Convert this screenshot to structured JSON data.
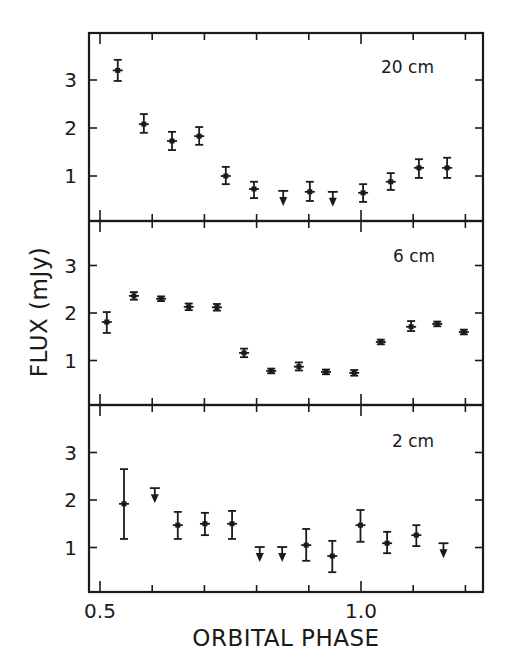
{
  "chart_data": {
    "type": "scatter",
    "title": "",
    "xlabel": "ORBITAL PHASE",
    "ylabel": "FLUX (mJy)",
    "xlim": [
      0.479,
      1.233
    ],
    "x_ticks": [
      0.5,
      0.6,
      0.7,
      0.8,
      0.9,
      1.0,
      1.1,
      1.2
    ],
    "x_tick_labels": [
      {
        "value": 0.5,
        "label": "0.5"
      },
      {
        "value": 1.0,
        "label": "1.0"
      }
    ],
    "grid": false,
    "legend": null,
    "panels": [
      {
        "label": "20 cm",
        "ylim": [
          0,
          3.9
        ],
        "y_ticks": [
          1,
          2,
          3
        ],
        "y_tick_labels": [
          "1",
          "2",
          "3"
        ],
        "points": [
          {
            "x": 0.534,
            "y": 3.2,
            "ylo": 2.98,
            "yhi": 3.42,
            "upper_limit": false
          },
          {
            "x": 0.584,
            "y": 2.08,
            "ylo": 1.9,
            "yhi": 2.29,
            "upper_limit": false
          },
          {
            "x": 0.638,
            "y": 1.73,
            "ylo": 1.54,
            "yhi": 1.92,
            "upper_limit": false
          },
          {
            "x": 0.69,
            "y": 1.83,
            "ylo": 1.65,
            "yhi": 2.02,
            "upper_limit": false
          },
          {
            "x": 0.741,
            "y": 1.0,
            "ylo": 0.83,
            "yhi": 1.19,
            "upper_limit": false
          },
          {
            "x": 0.795,
            "y": 0.73,
            "ylo": 0.54,
            "yhi": 0.88,
            "upper_limit": false
          },
          {
            "x": 0.851,
            "y": 0.69,
            "upper_limit": true
          },
          {
            "x": 0.902,
            "y": 0.67,
            "ylo": 0.48,
            "yhi": 0.88,
            "upper_limit": false
          },
          {
            "x": 0.946,
            "y": 0.67,
            "upper_limit": true
          },
          {
            "x": 1.004,
            "y": 0.65,
            "ylo": 0.46,
            "yhi": 0.83,
            "upper_limit": false
          },
          {
            "x": 1.057,
            "y": 0.88,
            "ylo": 0.71,
            "yhi": 1.06,
            "upper_limit": false
          },
          {
            "x": 1.111,
            "y": 1.17,
            "ylo": 0.96,
            "yhi": 1.35,
            "upper_limit": false
          },
          {
            "x": 1.165,
            "y": 1.17,
            "ylo": 0.96,
            "yhi": 1.38,
            "upper_limit": false
          }
        ]
      },
      {
        "label": "6 cm",
        "ylim": [
          0,
          3.9
        ],
        "y_ticks": [
          1,
          2,
          3
        ],
        "y_tick_labels": [
          "1",
          "2",
          "3"
        ],
        "points": [
          {
            "x": 0.513,
            "y": 1.81,
            "ylo": 1.58,
            "yhi": 2.02,
            "upper_limit": false
          },
          {
            "x": 0.565,
            "y": 2.36,
            "ylo": 2.28,
            "yhi": 2.44,
            "upper_limit": false
          },
          {
            "x": 0.617,
            "y": 2.3,
            "ylo": 2.25,
            "yhi": 2.35,
            "upper_limit": false
          },
          {
            "x": 0.67,
            "y": 2.13,
            "ylo": 2.06,
            "yhi": 2.2,
            "upper_limit": false
          },
          {
            "x": 0.724,
            "y": 2.12,
            "ylo": 2.05,
            "yhi": 2.19,
            "upper_limit": false
          },
          {
            "x": 0.776,
            "y": 1.16,
            "ylo": 1.07,
            "yhi": 1.25,
            "upper_limit": false
          },
          {
            "x": 0.828,
            "y": 0.78,
            "ylo": 0.73,
            "yhi": 0.83,
            "upper_limit": false
          },
          {
            "x": 0.881,
            "y": 0.87,
            "ylo": 0.79,
            "yhi": 0.96,
            "upper_limit": false
          },
          {
            "x": 0.933,
            "y": 0.76,
            "ylo": 0.71,
            "yhi": 0.81,
            "upper_limit": false
          },
          {
            "x": 0.987,
            "y": 0.74,
            "ylo": 0.68,
            "yhi": 0.8,
            "upper_limit": false
          },
          {
            "x": 1.038,
            "y": 1.39,
            "ylo": 1.34,
            "yhi": 1.44,
            "upper_limit": false
          },
          {
            "x": 1.096,
            "y": 1.71,
            "ylo": 1.62,
            "yhi": 1.83,
            "upper_limit": false
          },
          {
            "x": 1.146,
            "y": 1.77,
            "ylo": 1.72,
            "yhi": 1.82,
            "upper_limit": false
          },
          {
            "x": 1.197,
            "y": 1.6,
            "ylo": 1.55,
            "yhi": 1.65,
            "upper_limit": false
          }
        ]
      },
      {
        "label": "2 cm",
        "ylim": [
          0,
          3.9
        ],
        "y_ticks": [
          1,
          2,
          3
        ],
        "y_tick_labels": [
          "1",
          "2",
          "3"
        ],
        "points": [
          {
            "x": 0.546,
            "y": 1.92,
            "ylo": 1.18,
            "yhi": 2.65,
            "upper_limit": false
          },
          {
            "x": 0.605,
            "y": 2.25,
            "upper_limit": true
          },
          {
            "x": 0.649,
            "y": 1.47,
            "ylo": 1.18,
            "yhi": 1.75,
            "upper_limit": false
          },
          {
            "x": 0.701,
            "y": 1.5,
            "ylo": 1.26,
            "yhi": 1.73,
            "upper_limit": false
          },
          {
            "x": 0.753,
            "y": 1.5,
            "ylo": 1.18,
            "yhi": 1.77,
            "upper_limit": false
          },
          {
            "x": 0.806,
            "y": 1.01,
            "upper_limit": true
          },
          {
            "x": 0.849,
            "y": 1.01,
            "upper_limit": true
          },
          {
            "x": 0.895,
            "y": 1.05,
            "ylo": 0.72,
            "yhi": 1.39,
            "upper_limit": false
          },
          {
            "x": 0.945,
            "y": 0.82,
            "ylo": 0.48,
            "yhi": 1.14,
            "upper_limit": false
          },
          {
            "x": 0.999,
            "y": 1.47,
            "ylo": 1.12,
            "yhi": 1.79,
            "upper_limit": false
          },
          {
            "x": 1.05,
            "y": 1.09,
            "ylo": 0.88,
            "yhi": 1.33,
            "upper_limit": false
          },
          {
            "x": 1.106,
            "y": 1.26,
            "ylo": 1.03,
            "yhi": 1.47,
            "upper_limit": false
          },
          {
            "x": 1.158,
            "y": 1.09,
            "upper_limit": true
          }
        ]
      }
    ]
  },
  "layout": {
    "plot_left_px": 89,
    "plot_right_px": 483,
    "x_px_at_0_5": 100,
    "x_px_per_unit": 522,
    "panels_px": [
      {
        "top": 33,
        "bottom": 221,
        "zero_y": 224,
        "px_per_unit": 48,
        "label_x": 381,
        "label_y": 73
      },
      {
        "top": 221,
        "bottom": 405,
        "zero_y": 408,
        "px_per_unit": 47.5,
        "label_x": 393,
        "label_y": 262
      },
      {
        "top": 405,
        "bottom": 592,
        "zero_y": 595,
        "px_per_unit": 47.5,
        "label_x": 392,
        "label_y": 447
      }
    ]
  },
  "colors": {
    "ink": "#1a1a1a",
    "background": "#ffffff"
  }
}
